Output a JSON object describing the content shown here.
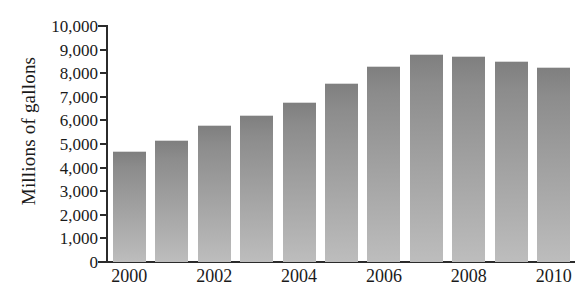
{
  "chart_data": {
    "type": "bar",
    "title": "",
    "subtitle": "",
    "xlabel": "",
    "ylabel": "Millions of gallons",
    "categories": [
      "2000",
      "2001",
      "2002",
      "2003",
      "2004",
      "2005",
      "2006",
      "2007",
      "2008",
      "2009",
      "2010"
    ],
    "values": [
      4700,
      5150,
      5800,
      6250,
      6800,
      7600,
      8300,
      8800,
      8750,
      8500,
      8250
    ],
    "ylim": [
      0,
      10000
    ],
    "ytick_values": [
      0,
      1000,
      2000,
      3000,
      4000,
      5000,
      6000,
      7000,
      8000,
      9000,
      10000
    ],
    "ytick_labels": [
      "0",
      "1,000",
      "2,000",
      "3,000",
      "4,000",
      "5,000",
      "6,000",
      "7,000",
      "8,000",
      "9,000",
      "10,000"
    ],
    "xtick_labels_shown": [
      "2000",
      "2002",
      "2004",
      "2006",
      "2008",
      "2010"
    ],
    "grid": false,
    "legend": null,
    "legend_position": "none",
    "bar_color_top": "#7f7f7f",
    "bar_color_bottom": "#bdbdbd",
    "axis_color": "#2b2b2b",
    "text_color": "#1a1a1a",
    "background_color": "#ffffff"
  }
}
